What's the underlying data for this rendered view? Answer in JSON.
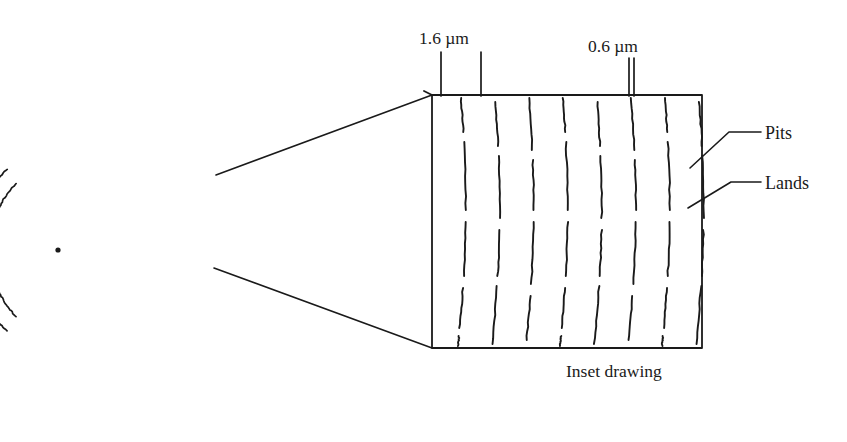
{
  "figure": {
    "background_color": "#ffffff",
    "ink_color": "#1a1a1a"
  },
  "dimensions": {
    "track_pitch": {
      "label": "1.6 µm",
      "name": "track-pitch-dimension",
      "tick_x_left": 441,
      "tick_x_right": 481,
      "tick_top_y": 52,
      "tick_bottom_y": 96,
      "text_x": 419,
      "text_y": 44
    },
    "pit_width": {
      "label": "0.6 µm",
      "name": "pit-width-dimension",
      "tick_x_left": 629,
      "tick_x_right": 634,
      "tick_top_y": 58,
      "tick_bottom_y": 96,
      "text_x": 588,
      "text_y": 52
    }
  },
  "callouts": [
    {
      "label": "Pits",
      "name": "pits",
      "text_x": 765,
      "text_y": 139,
      "anchor_x": 690,
      "anchor_y": 168,
      "elbow_x": 729,
      "elbow_y": 132,
      "end_x": 761,
      "end_y": 132
    },
    {
      "label": "Lands",
      "name": "lands",
      "text_x": 765,
      "text_y": 189,
      "anchor_x": 688,
      "anchor_y": 208,
      "elbow_x": 731,
      "elbow_y": 182,
      "end_x": 761,
      "end_y": 182
    }
  ],
  "caption": {
    "text": "Inset drawing",
    "x": 566,
    "y": 377
  },
  "disc": {
    "name": "disc-spiral",
    "center_x": 58,
    "center_y": 250,
    "center_dot_radius": 2.6,
    "arc_count": 7,
    "arc_radii": [
      68,
      83,
      98,
      113,
      128,
      143,
      158
    ],
    "arc_start_angle_deg": 128,
    "arc_end_angle_deg": 232
  },
  "inset_box": {
    "name": "inset-box",
    "left": 432,
    "top": 95,
    "right": 702,
    "bottom": 348,
    "top_left_notch_x": 424,
    "top_left_notch_y": 91
  },
  "magnifier": {
    "name": "magnification-cone",
    "source_top_x": 216,
    "source_top_y": 175,
    "source_bottom_x": 214,
    "source_bottom_y": 268,
    "target_top_x": 432,
    "target_top_y": 95,
    "target_bottom_x": 432,
    "target_bottom_y": 348
  },
  "pit_tracks": {
    "name": "pit-track-group",
    "track_count": 8,
    "first_track_x": 455,
    "track_spacing": 34,
    "top_y": 98,
    "bottom_y": 346,
    "curve_bow": 9,
    "dash_pattern": [
      [
        0,
        34
      ],
      [
        44,
        68
      ],
      [
        124,
        54
      ],
      [
        190,
        40
      ],
      [
        238,
        56
      ]
    ],
    "dash_pattern_alt": [
      [
        4,
        44
      ],
      [
        58,
        62
      ],
      [
        132,
        46
      ],
      [
        188,
        58
      ],
      [
        254,
        38
      ]
    ],
    "dash_pattern_third": [
      [
        0,
        52
      ],
      [
        62,
        50
      ],
      [
        124,
        62
      ],
      [
        198,
        44
      ],
      [
        250,
        44
      ]
    ]
  }
}
